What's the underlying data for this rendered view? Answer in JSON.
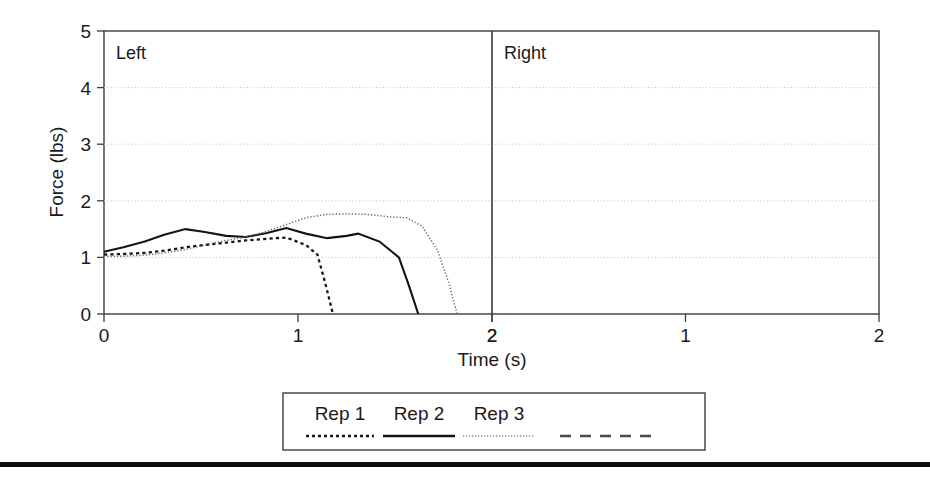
{
  "figure": {
    "bottom_rule": true
  },
  "chart_data": {
    "type": "line",
    "title": "",
    "xlabel": "Time (s)",
    "ylabel": "Force (lbs)",
    "xlim": [
      0,
      2
    ],
    "ylim": [
      0,
      5
    ],
    "grid": true,
    "grid_axis": "y",
    "legend_position": "bottom-center",
    "panels": [
      {
        "name": "left",
        "label": "Left",
        "xticks": [
          0,
          1,
          2
        ],
        "xticklabels": [
          "0",
          "1",
          "2"
        ],
        "series": [
          {
            "name": "Rep 1",
            "style": "dotted-thick",
            "x": [
              0.0,
              0.1,
              0.21,
              0.31,
              0.42,
              0.52,
              0.63,
              0.73,
              0.84,
              0.94,
              1.04,
              1.1,
              1.14,
              1.18
            ],
            "y": [
              1.05,
              1.06,
              1.08,
              1.12,
              1.18,
              1.22,
              1.26,
              1.3,
              1.33,
              1.35,
              1.22,
              1.05,
              0.55,
              0.0
            ]
          },
          {
            "name": "Rep 2",
            "style": "solid",
            "x": [
              0.0,
              0.1,
              0.21,
              0.31,
              0.42,
              0.52,
              0.63,
              0.73,
              0.84,
              0.94,
              1.04,
              1.15,
              1.25,
              1.31,
              1.42,
              1.52,
              1.57,
              1.62
            ],
            "y": [
              1.1,
              1.18,
              1.28,
              1.4,
              1.5,
              1.45,
              1.38,
              1.36,
              1.43,
              1.52,
              1.42,
              1.34,
              1.38,
              1.42,
              1.28,
              1.0,
              0.52,
              0.0
            ]
          },
          {
            "name": "Rep 3",
            "style": "dotted-fine",
            "x": [
              0.0,
              0.1,
              0.21,
              0.31,
              0.42,
              0.52,
              0.63,
              0.73,
              0.84,
              0.94,
              1.04,
              1.15,
              1.25,
              1.36,
              1.46,
              1.56,
              1.64,
              1.72,
              1.78,
              1.82
            ],
            "y": [
              1.02,
              1.02,
              1.04,
              1.08,
              1.14,
              1.22,
              1.3,
              1.36,
              1.46,
              1.58,
              1.7,
              1.76,
              1.77,
              1.76,
              1.72,
              1.7,
              1.55,
              1.12,
              0.52,
              0.0
            ]
          }
        ]
      },
      {
        "name": "right",
        "label": "Right",
        "xticks": [
          0,
          1,
          2
        ],
        "xticklabels": [
          "2",
          "1",
          "2"
        ],
        "series": []
      }
    ],
    "yticks": [
      0,
      1,
      2,
      3,
      4,
      5
    ],
    "yticklabels": [
      "0",
      "1",
      "2",
      "3",
      "4",
      "5"
    ],
    "legend": [
      {
        "label": "Rep 1",
        "style": "dotted-thick"
      },
      {
        "label": "Rep 2",
        "style": "solid"
      },
      {
        "label": "Rep 3",
        "style": "dotted-fine"
      },
      {
        "label": "",
        "style": "dashed"
      }
    ]
  }
}
